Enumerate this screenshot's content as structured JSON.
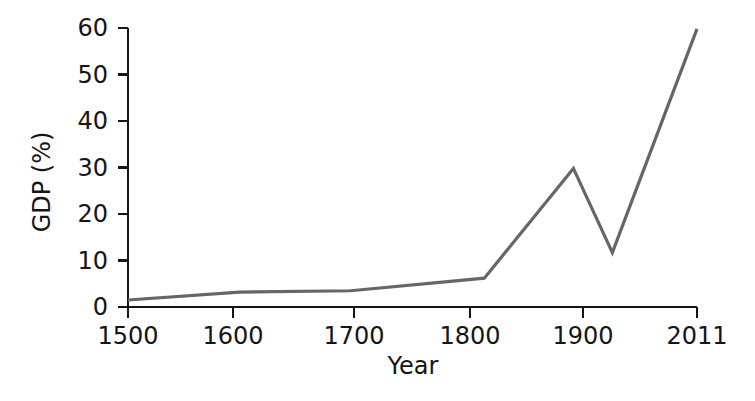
{
  "chart_data": {
    "type": "line",
    "title": "",
    "subtitle": "",
    "xlabel": "Year",
    "ylabel": "GDP (%)",
    "x": [
      1500,
      1600,
      1700,
      1820,
      1900,
      1935,
      2011
    ],
    "values": [
      1.5,
      3.2,
      3.5,
      6.2,
      29.8,
      11.7,
      59.8
    ],
    "series": [
      {
        "name": "GDP (%)",
        "x": [
          1500,
          1600,
          1700,
          1820,
          1900,
          1935,
          2011
        ],
        "values": [
          1.5,
          3.2,
          3.5,
          6.2,
          29.8,
          11.7,
          59.8
        ]
      }
    ],
    "xlim": [
      1500,
      2011
    ],
    "ylim": [
      0,
      60
    ],
    "x_ticks": [
      1500,
      1600,
      1700,
      1800,
      1900,
      2011
    ],
    "x_tick_labels": [
      "1500",
      "1600",
      "1700",
      "1800",
      "1900",
      "2011"
    ],
    "y_ticks": [
      0,
      10,
      20,
      30,
      40,
      50,
      60
    ],
    "y_tick_labels": [
      "0",
      "10",
      "20",
      "30",
      "40",
      "50",
      "60"
    ],
    "grid": false,
    "legend": null,
    "legend_position": "none",
    "line_color": "#666666",
    "axis_color": "#151515",
    "background_color": "#ffffff",
    "annotations": []
  },
  "axes": {
    "y_title": "GDP (%)",
    "x_title": "Year"
  }
}
